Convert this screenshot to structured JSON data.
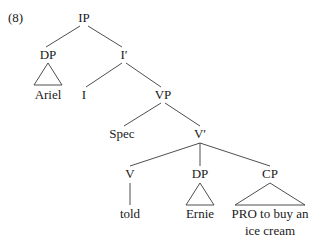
{
  "example_number": "(8)",
  "tree": {
    "root": "IP",
    "nodes": {
      "ip": "IP",
      "dp_subject": "DP",
      "ariel": "Ariel",
      "i_bar": "I′",
      "i": "I",
      "vp": "VP",
      "spec": "Spec",
      "v_bar": "V′",
      "v": "V",
      "told": "told",
      "dp_object": "DP",
      "ernie": "Ernie",
      "cp": "CP",
      "cp_text_line1": "PRO to buy an",
      "cp_text_line2": "ice cream"
    }
  }
}
